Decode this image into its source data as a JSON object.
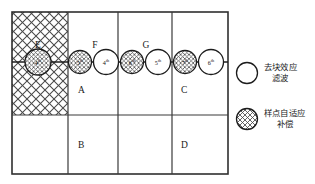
{
  "diagram": {
    "type": "coding-unit-partition-with-filter-order",
    "grid": {
      "columns": 4,
      "rows": 2,
      "cell_labels": [
        {
          "id": "E",
          "label": "E",
          "region": "top-left-hatched"
        },
        {
          "id": "A",
          "label": "A",
          "region": "top-col2"
        },
        {
          "id": "C",
          "label": "C",
          "region": "top-col4"
        },
        {
          "id": "B",
          "label": "B",
          "region": "bottom-col2"
        },
        {
          "id": "D",
          "label": "D",
          "region": "bottom-col4"
        }
      ],
      "edge_labels": [
        {
          "id": "F",
          "label": "F"
        },
        {
          "id": "G",
          "label": "G"
        }
      ]
    },
    "nodes": [
      {
        "id": "n1",
        "label": "4",
        "ordinal_suffix": "th",
        "style": "hatched"
      },
      {
        "id": "n2",
        "label": "5",
        "ordinal_suffix": "th",
        "style": "hatched"
      },
      {
        "id": "n3",
        "label": "4",
        "ordinal_suffix": "th",
        "style": "plain"
      },
      {
        "id": "n4",
        "label": "6",
        "ordinal_suffix": "th",
        "style": "hatched"
      },
      {
        "id": "n5",
        "label": "5",
        "ordinal_suffix": "th",
        "style": "plain"
      },
      {
        "id": "n6",
        "label": "7",
        "ordinal_suffix": "th",
        "style": "hatched"
      },
      {
        "id": "n7",
        "label": "6",
        "ordinal_suffix": "th",
        "style": "plain"
      }
    ]
  },
  "legend": {
    "items": [
      {
        "style": "plain",
        "line1": "去块效应",
        "line2": "滤波",
        "full_text": "去块效应滤波"
      },
      {
        "style": "hatched",
        "line1": "样点自适应",
        "line2": "补偿",
        "full_text": "样点自适应补偿"
      }
    ]
  },
  "colors": {
    "line": "#2f2f2f",
    "inner_line": "#3a3a3a",
    "hatch": "#4a4a4a",
    "text": "#1a1a1a",
    "background": "#ffffff"
  }
}
